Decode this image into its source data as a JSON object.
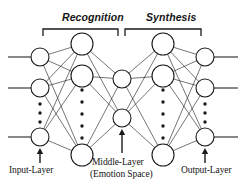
{
  "figure": {
    "name": "neural-network-autoencoder-diagram",
    "background_color": "#ffffff",
    "stroke_color": "#1a1a1a",
    "node_fill": "#ffffff",
    "width": 244,
    "height": 183
  },
  "braces": {
    "recognition": "Recognition",
    "synthesis": "Synthesis"
  },
  "labels": {
    "input_layer": "Input-Layer",
    "middle_layer": "Middle-Layer",
    "emotion_space": "(Emotion Space)",
    "output_layer": "Output-Layer"
  },
  "chart_data": {
    "type": "diagram",
    "layers": [
      {
        "id": "input",
        "label": "Input-Layer",
        "x": 40,
        "node_radius": 9,
        "visible_nodes": 3,
        "node_y": [
          57,
          88,
          137
        ],
        "ellipsis_dots": 3,
        "ellipsis_y": [
          104,
          113,
          122
        ],
        "has_external_stubs": true,
        "stub_side": "left",
        "stub_x_from": 8,
        "has_arrow": true,
        "arrow_y_from": 163,
        "arrow_y_to": 148
      },
      {
        "id": "hidden_encoder",
        "label": "",
        "x": 82,
        "node_radius": 11,
        "visible_nodes": 3,
        "node_y": [
          44,
          76,
          155
        ],
        "ellipsis_dots": 5,
        "ellipsis_y": [
          90,
          102,
          114,
          126,
          138
        ],
        "has_external_stubs": false,
        "has_arrow": false
      },
      {
        "id": "middle",
        "label": "Middle-Layer",
        "sublabel": "(Emotion Space)",
        "x": 122,
        "node_radius": 9,
        "visible_nodes": 2,
        "node_y": [
          79,
          118
        ],
        "ellipsis_dots": 0,
        "ellipsis_y": [],
        "has_external_stubs": false,
        "has_arrow": true,
        "arrow_y_from": 153,
        "arrow_y_to": 129
      },
      {
        "id": "hidden_decoder",
        "label": "",
        "x": 163,
        "node_radius": 11,
        "visible_nodes": 3,
        "node_y": [
          44,
          76,
          155
        ],
        "ellipsis_dots": 5,
        "ellipsis_y": [
          90,
          102,
          114,
          126,
          138
        ],
        "has_external_stubs": false,
        "has_arrow": false
      },
      {
        "id": "output",
        "label": "Output-Layer",
        "x": 205,
        "node_radius": 9,
        "visible_nodes": 3,
        "node_y": [
          57,
          88,
          137
        ],
        "ellipsis_dots": 3,
        "ellipsis_y": [
          104,
          113,
          122
        ],
        "has_external_stubs": true,
        "stub_side": "right",
        "stub_x_to": 238,
        "has_arrow": true,
        "arrow_y_from": 163,
        "arrow_y_to": 148
      }
    ],
    "connections": [
      {
        "from": "input",
        "to": "hidden_encoder",
        "pattern": "fully-connected"
      },
      {
        "from": "hidden_encoder",
        "to": "middle",
        "pattern": "fully-connected"
      },
      {
        "from": "middle",
        "to": "hidden_decoder",
        "pattern": "fully-connected"
      },
      {
        "from": "hidden_decoder",
        "to": "output",
        "pattern": "fully-connected"
      }
    ],
    "braces": [
      {
        "label": "Recognition",
        "x_from": 43,
        "x_to": 118,
        "y": 29,
        "tick_height": 7
      },
      {
        "label": "Synthesis",
        "x_from": 125,
        "x_to": 201,
        "y": 29,
        "tick_height": 7
      }
    ]
  }
}
